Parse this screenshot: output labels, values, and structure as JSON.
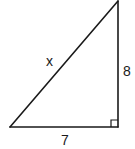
{
  "diagram": {
    "type": "right-triangle",
    "labels": {
      "hypotenuse": "x",
      "vertical_leg": "8",
      "horizontal_leg": "7"
    },
    "right_angle_marker": true,
    "stroke_color": "#1a1a1a",
    "background": "#ffffff"
  }
}
